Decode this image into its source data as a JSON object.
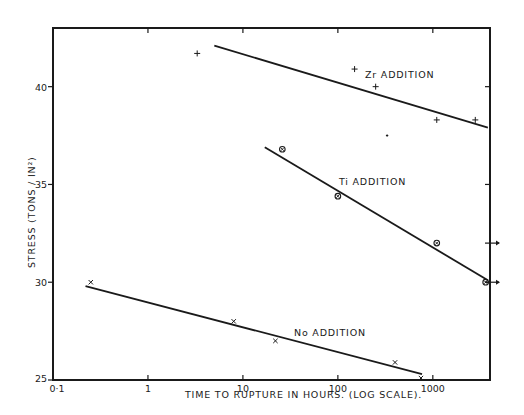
{
  "chart_data": {
    "type": "line",
    "title": "",
    "xlabel": "TIME TO RUPTURE IN HOURS. (LOG SCALE).",
    "ylabel": "STRESS (TONS / IN²)",
    "xscale": "log",
    "xlim": [
      0.1,
      4000
    ],
    "ylim": [
      25,
      43
    ],
    "x_ticks": [
      0.1,
      1,
      10,
      100,
      1000
    ],
    "x_tick_labels": [
      "0·1",
      "1",
      "10",
      "100",
      "1000"
    ],
    "y_ticks": [
      25,
      30,
      35,
      40
    ],
    "y_tick_labels": [
      "25",
      "30",
      "35",
      "40"
    ],
    "grid": false,
    "series": [
      {
        "name": "Zr ADDITION",
        "marker": "+",
        "points": [
          {
            "x": 3.3,
            "y": 41.7
          },
          {
            "x": 150,
            "y": 40.9
          },
          {
            "x": 250,
            "y": 40.0
          },
          {
            "x": 330,
            "y": 37.5
          },
          {
            "x": 1100,
            "y": 38.3
          },
          {
            "x": 2800,
            "y": 38.3
          }
        ],
        "fit_line": [
          {
            "x": 5,
            "y": 42.1
          },
          {
            "x": 3800,
            "y": 37.9
          }
        ]
      },
      {
        "name": "Ti ADDITION",
        "marker": "circled-x",
        "points": [
          {
            "x": 26,
            "y": 36.8
          },
          {
            "x": 100,
            "y": 34.4
          },
          {
            "x": 1100,
            "y": 32.0
          },
          {
            "x": 3600,
            "y": 30.0
          }
        ],
        "fit_line": [
          {
            "x": 17,
            "y": 36.9
          },
          {
            "x": 3800,
            "y": 30.1
          }
        ]
      },
      {
        "name": "No ADDITION",
        "marker": "x",
        "points": [
          {
            "x": 0.25,
            "y": 30.0
          },
          {
            "x": 8,
            "y": 28.0
          },
          {
            "x": 22,
            "y": 27.0
          },
          {
            "x": 400,
            "y": 25.9
          },
          {
            "x": 750,
            "y": 25.1
          }
        ],
        "fit_line": [
          {
            "x": 0.22,
            "y": 29.8
          },
          {
            "x": 770,
            "y": 25.3
          }
        ]
      }
    ],
    "annotations": [
      {
        "text": "Zr ADDITION",
        "x": 250,
        "y": 40.6
      },
      {
        "text": "Ti ADDITION",
        "x": 140,
        "y": 35.4
      },
      {
        "text": "No ADDITION",
        "x": 30,
        "y": 27.2
      },
      {
        "text": "unbroken (arrow)",
        "x": 4000,
        "y": 32.0
      },
      {
        "text": "unbroken (arrow)",
        "x": 4000,
        "y": 30.0
      }
    ]
  },
  "labels": {
    "xlabel": "TIME TO RUPTURE IN HOURS. (LOG SCALE).",
    "ylabel": "STRESS (TONS / IN²)",
    "zr": "Zr ADDITION",
    "ti": "Ti ADDITION",
    "no": "No ADDITION"
  }
}
